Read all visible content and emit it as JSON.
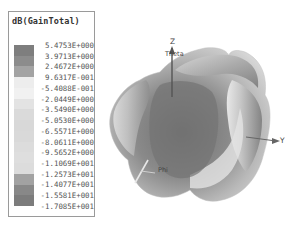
{
  "chart_data": {
    "type": "heatmap",
    "title": "dB(GainTotal)",
    "subtitle": "3D radiation pattern",
    "colorbar": {
      "labels": [
        "5.4753E+000",
        "3.9713E+000",
        "2.4672E+000",
        "9.6317E-001",
        "-5.4088E-001",
        "-2.0449E+000",
        "-3.5490E+000",
        "-5.0530E+000",
        "-6.5571E+000",
        "-8.0611E+000",
        "-9.5652E+000",
        "-1.1069E+001",
        "-1.2573E+001",
        "-1.4077E+001",
        "-1.5581E+001",
        "-1.7085E+001"
      ],
      "values": [
        5.4753,
        3.9713,
        2.4672,
        0.96317,
        -0.54088,
        -2.0449,
        -3.549,
        -5.053,
        -6.5571,
        -8.0611,
        -9.5652,
        -11.069,
        -12.573,
        -14.077,
        -15.581,
        -17.085
      ],
      "band_colors": [
        "#7e7e7e",
        "#8c8c8c",
        "#a3a3a3",
        "#ededed",
        "#f1f1f1",
        "#e3e3e3",
        "#dadada",
        "#d8d8d8",
        "#d9d9d9",
        "#dcdcdc",
        "#dedede",
        "#dcdcdc",
        "#a2a2a2",
        "#888888",
        "#7c7c7c"
      ],
      "range": [
        -17.085,
        5.4753
      ]
    },
    "axes": {
      "labels": [
        "Z",
        "Y",
        "Theta",
        "Phi"
      ]
    },
    "grid": false,
    "legend_position": "left"
  },
  "legend": {
    "title": "dB(GainTotal)"
  },
  "axes": {
    "z": "Z",
    "y": "Y",
    "theta": "Theta",
    "phi": "Phi"
  }
}
